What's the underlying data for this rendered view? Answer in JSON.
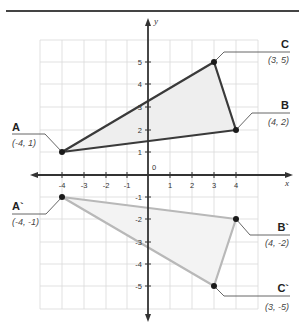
{
  "header": {
    "title_fragment": "",
    "rule": true
  },
  "axes": {
    "x_label": "x",
    "y_label": "y",
    "origin_label": "0",
    "x_ticks": [
      "-4",
      "-3",
      "-2",
      "-1",
      "1",
      "2",
      "3",
      "4"
    ],
    "y_ticks_positive": [
      "1",
      "2",
      "3",
      "4",
      "5"
    ],
    "y_ticks_negative": [
      "-1",
      "-2",
      "-3",
      "-4",
      "-5"
    ]
  },
  "triangle_original": {
    "points": [
      {
        "name": "A",
        "coord": "(-4, 1)",
        "x": -4,
        "y": 1
      },
      {
        "name": "B",
        "coord": "(4, 2)",
        "x": 4,
        "y": 2
      },
      {
        "name": "C",
        "coord": "(3, 5)",
        "x": 3,
        "y": 5
      }
    ],
    "stroke": "#3a3a3a",
    "fill": "#eeeeee"
  },
  "triangle_reflected": {
    "points": [
      {
        "name": "A`",
        "coord": "(-4, -1)",
        "x": -4,
        "y": -1
      },
      {
        "name": "B`",
        "coord": "(4, -2)",
        "x": 4,
        "y": -2
      },
      {
        "name": "C`",
        "coord": "(3, -5)",
        "x": 3,
        "y": -5
      }
    ],
    "stroke": "#b8b8b8",
    "fill": "#f2f2f2"
  },
  "colors": {
    "grid": "#d9d9d9",
    "axis": "#333333",
    "point": "#1a1a1a"
  }
}
